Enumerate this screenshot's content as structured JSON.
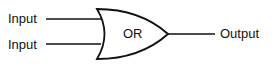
{
  "diagram": {
    "type": "logic-gate",
    "gate": {
      "label": "OR"
    },
    "inputs": [
      {
        "label": "Input"
      },
      {
        "label": "Input"
      }
    ],
    "output": {
      "label": "Output"
    },
    "colors": {
      "stroke": "#111111",
      "background": "#ffffff"
    }
  }
}
